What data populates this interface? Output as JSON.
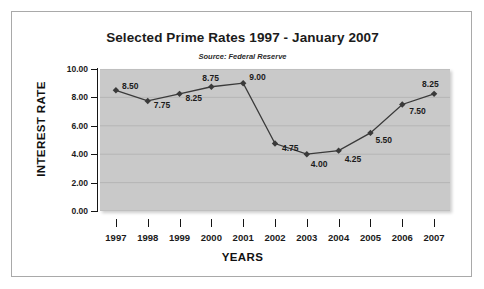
{
  "chart_data": {
    "type": "line",
    "title": "Selected Prime Rates 1997 - January 2007",
    "subtitle": "Source:  Federal Reserve",
    "xlabel": "YEARS",
    "ylabel": "INTEREST RATE",
    "categories": [
      "1997",
      "1998",
      "1999",
      "2000",
      "2001",
      "2002",
      "2003",
      "2004",
      "2005",
      "2006",
      "2007"
    ],
    "values": [
      8.5,
      7.75,
      8.25,
      8.75,
      9.0,
      4.75,
      4.0,
      4.25,
      5.5,
      7.5,
      8.25
    ],
    "point_labels": [
      "8.50",
      "7.75",
      "8.25",
      "8.75",
      "9.00",
      "4.75",
      "4.00",
      "4.25",
      "5.50",
      "7.50",
      "8.25"
    ],
    "ylim": [
      0.0,
      10.0
    ],
    "ytick_labels": [
      "10.00",
      "8.00",
      "6.00",
      "4.00",
      "2.00",
      "0.00"
    ],
    "ytick_values": [
      10.0,
      8.0,
      6.0,
      4.0,
      2.0,
      0.0
    ],
    "grid": true,
    "legend": false,
    "series_name": "Prime Rate",
    "colors": {
      "plot_background": "#c9c9c9",
      "gridline": "#b3b3b3",
      "line": "#3a3a3a",
      "marker": "#3a3a3a",
      "text": "#1b1b1b",
      "frame_border": "#a9a9a9",
      "page_background": "#ffffff"
    },
    "marker_shape": "diamond"
  }
}
